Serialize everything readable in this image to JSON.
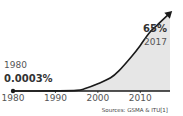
{
  "chart_data": {
    "type": "area",
    "title": "",
    "xlabel": "",
    "ylabel": "",
    "x": [
      1980,
      1990,
      1995,
      1997,
      2000,
      2003,
      2005,
      2008,
      2010,
      2012,
      2014,
      2017
    ],
    "values": [
      0.0003,
      0.1,
      0.5,
      2,
      6,
      11,
      17,
      29,
      38,
      48,
      55,
      65
    ],
    "xlim": [
      1980,
      2017
    ],
    "ylim": [
      0,
      70
    ],
    "xticks": [
      "1980",
      "1990",
      "2000",
      "2010"
    ],
    "grid": false,
    "legend": "none",
    "annotations": {
      "start_year": "1980",
      "start_value": "0.0003%",
      "end_value": "65%",
      "end_year": "2017"
    },
    "source": "Sources: GSMA & ITU[1]",
    "colors": {
      "line": "#1a1a1a",
      "fill": "#e6e6e6"
    }
  }
}
